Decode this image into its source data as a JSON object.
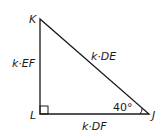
{
  "diagram": {
    "type": "right-triangle",
    "vertices": {
      "K": "K",
      "L": "L",
      "J": "J"
    },
    "sides": {
      "KL": "k·EF",
      "KJ": "k·DE",
      "LJ": "k·DF"
    },
    "angle_J": "40°",
    "right_angle_at": "L",
    "stroke_color": "#1a1a1a"
  }
}
